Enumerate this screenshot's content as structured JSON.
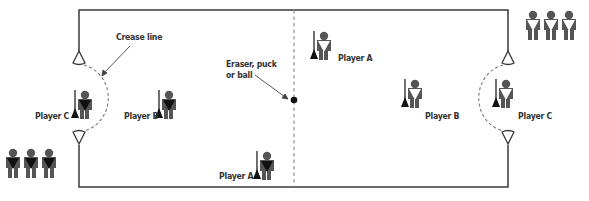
{
  "diagram": {
    "type": "game field diagram",
    "labels": {
      "crease_line": "Crease line",
      "ball_line1": "Eraser, puck",
      "ball_line2": "or ball",
      "left_player_c": "Player C",
      "left_player_b": "Player B",
      "center_player_a_bottom": "Player A",
      "center_player_a_top": "Player A",
      "right_player_b": "Player B",
      "right_player_c": "Player C"
    },
    "teams": [
      {
        "side": "left",
        "shirt": "dark",
        "bench_count": 3,
        "field_players": [
          "Player C",
          "Player B",
          "Player A"
        ]
      },
      {
        "side": "right",
        "shirt": "white",
        "bench_count": 3,
        "field_players": [
          "Player A",
          "Player B",
          "Player C"
        ]
      }
    ],
    "colors": {
      "line": "#3a3a3a",
      "figure": "#555555",
      "dark_shirt": "#1a1a1a",
      "light_shirt": "#ffffff",
      "dashed": "#777777"
    }
  }
}
